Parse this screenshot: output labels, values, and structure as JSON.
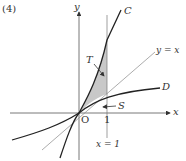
{
  "problem_number": "(4)",
  "axes": {
    "x_label": "x",
    "y_label": "y",
    "origin_label": "O",
    "tick_label": "1"
  },
  "curves": [
    {
      "name": "C",
      "label": "C"
    },
    {
      "name": "D",
      "label": "D"
    },
    {
      "name": "identity-line",
      "label": "y = x"
    },
    {
      "name": "vertical-line",
      "label": "x = 1"
    }
  ],
  "regions": [
    {
      "name": "T",
      "label": "T"
    },
    {
      "name": "S",
      "label": "S"
    }
  ],
  "colors": {
    "shade": "#c8c8c8",
    "stroke": "#333333",
    "thin": "#777777"
  }
}
